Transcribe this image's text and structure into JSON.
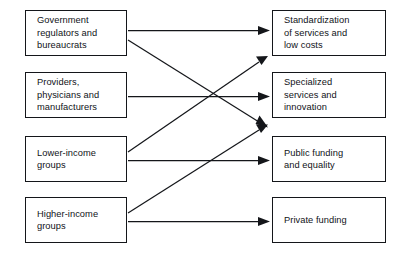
{
  "diagram": {
    "type": "flow-diagram",
    "background_color": "#ffffff",
    "line_color": "#14161a",
    "box_border_color": "#14161a",
    "inputs": [
      {
        "id": "government-regulators",
        "label": "Government\nregulators and\nbureaucrats"
      },
      {
        "id": "providers-physicians",
        "label": "Providers,\nphysicians and\nmanufacturers"
      },
      {
        "id": "lower-income-groups",
        "label": "Lower-income\ngroups"
      },
      {
        "id": "higher-income-groups",
        "label": "Higher-income\ngroups"
      }
    ],
    "outputs": [
      {
        "id": "standardization",
        "label": "Standardization\nof services and\nlow costs"
      },
      {
        "id": "specialized-services",
        "label": "Specialized\nservices and\ninnovation"
      },
      {
        "id": "public-funding",
        "label": "Public funding\nand equality"
      },
      {
        "id": "private-funding",
        "label": "Private funding"
      }
    ],
    "connections": [
      {
        "from": "government-regulators",
        "to": "standardization",
        "style": "straight"
      },
      {
        "from": "government-regulators",
        "to": "public-funding",
        "style": "diagonal-down"
      },
      {
        "from": "providers-physicians",
        "to": "specialized-services",
        "style": "straight"
      },
      {
        "from": "lower-income-groups",
        "to": "standardization",
        "style": "diagonal-up"
      },
      {
        "from": "lower-income-groups",
        "to": "public-funding",
        "style": "straight"
      },
      {
        "from": "higher-income-groups",
        "to": "specialized-services",
        "style": "diagonal-up"
      },
      {
        "from": "higher-income-groups",
        "to": "private-funding",
        "style": "straight"
      }
    ]
  }
}
